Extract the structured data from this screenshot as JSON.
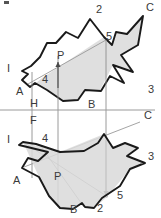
{
  "figure": {
    "ground_line_label_above": "H",
    "ground_line_label_below": "F",
    "colors": {
      "outline": "#1a1a1a",
      "thin_line": "#8a8a8a",
      "shade": "#d9d9d9",
      "ground_line": "#9a9a9a",
      "label": "#3a3a3a",
      "background": "#ffffff"
    }
  },
  "top_view": {
    "name": "horizontal-projection",
    "labels": [
      {
        "id": "t-2",
        "text": "2",
        "x": 96,
        "y": 13
      },
      {
        "id": "t-C",
        "text": "C",
        "x": 146,
        "y": 11
      },
      {
        "id": "t-5",
        "text": "5",
        "x": 106,
        "y": 40
      },
      {
        "id": "t-P",
        "text": "P",
        "x": 57,
        "y": 59
      },
      {
        "id": "t-I",
        "text": "I",
        "x": 7,
        "y": 72
      },
      {
        "id": "t-4",
        "text": "4",
        "x": 42,
        "y": 83
      },
      {
        "id": "t-A",
        "text": "A",
        "x": 16,
        "y": 95
      },
      {
        "id": "t-3",
        "text": "3",
        "x": 148,
        "y": 93
      },
      {
        "id": "t-B",
        "text": "B",
        "x": 88,
        "y": 108
      }
    ],
    "outline_points": "90,19 78,38 66,32 56,43 47,43 40,57 31,66 22,71 28,74 22,80 30,87 35,83 47,90 63,101 78,100 85,90 101,91 110,76 124,83 113,65 133,72 121,55 138,45 143,16 127,34 116,32 112,45 104,37",
    "shade_points": "30,88 42,78 104,37 112,45 116,32 127,34 143,16 138,45 121,55 133,72 113,65 100,90 85,90 78,100 63,101 47,90 35,83"
  },
  "bottom_view": {
    "name": "frontal-projection",
    "labels": [
      {
        "id": "b-C",
        "text": "C",
        "x": 144,
        "y": 119
      },
      {
        "id": "b-I",
        "text": "I",
        "x": 7,
        "y": 143
      },
      {
        "id": "b-4",
        "text": "4",
        "x": 42,
        "y": 142
      },
      {
        "id": "b-3",
        "text": "3",
        "x": 148,
        "y": 160
      },
      {
        "id": "b-P",
        "text": "P",
        "x": 54,
        "y": 180
      },
      {
        "id": "b-A",
        "text": "A",
        "x": 13,
        "y": 184
      },
      {
        "id": "b-5",
        "text": "5",
        "x": 117,
        "y": 199
      },
      {
        "id": "b-B",
        "text": "B",
        "x": 70,
        "y": 213
      },
      {
        "id": "b-2",
        "text": "2",
        "x": 97,
        "y": 212
      }
    ],
    "outline_points": "19,145 48,152 38,161 28,158 22,168 39,177 49,196 60,208 73,209 82,203 85,207 94,208 102,198 120,186 130,169 145,163 127,156 138,148 125,143 113,148 104,134 98,143 84,151 60,152 36,144 23,142",
    "shade_points": "23,142 60,152 104,134 113,148 125,143 138,148 127,156 145,163 130,169 107,197 94,208 85,207 82,203 73,209 60,208 49,196 39,177"
  },
  "construction": {
    "ground_line": {
      "y": 110,
      "x1": 0,
      "x2": 155
    },
    "vertical_lines": [
      {
        "id": "vline-4",
        "x": 32,
        "y1": 72,
        "y2": 178
      },
      {
        "id": "vline-P",
        "x": 58,
        "y1": 56,
        "y2": 207
      },
      {
        "id": "vline-5",
        "x": 106,
        "y1": 40,
        "y2": 198
      }
    ],
    "arrows": [
      {
        "id": "arrow-P-top",
        "x": 58,
        "y1": 88,
        "y2": 62
      },
      {
        "id": "arrow-5-bottom",
        "x": 106,
        "y1": 140,
        "y2": 196
      }
    ],
    "thin_diagonals": [
      {
        "id": "diag-top-P-5",
        "x1": 28,
        "y1": 84,
        "x2": 106,
        "y2": 40
      },
      {
        "id": "diag-bot-I-5",
        "x1": 23,
        "y1": 142,
        "x2": 108,
        "y2": 197
      },
      {
        "id": "diag-bot-4-B",
        "x1": 40,
        "y1": 145,
        "x2": 84,
        "y2": 207
      },
      {
        "id": "diag-bot-A-C",
        "x1": 24,
        "y1": 167,
        "x2": 140,
        "y2": 122
      }
    ]
  }
}
